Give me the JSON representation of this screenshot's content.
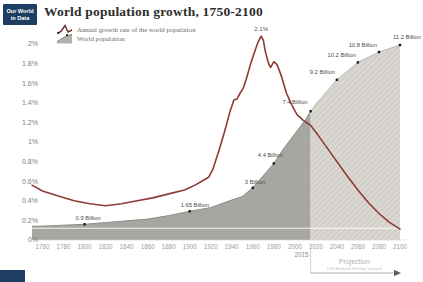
{
  "logo": {
    "line1": "Our World",
    "line2": "in Data"
  },
  "header": {
    "title": "World population growth, 1750-2100"
  },
  "legend": {
    "growth_label": "Annual growth rate of the world population",
    "population_label": "World population"
  },
  "colors": {
    "logo_bg": "#1d3d63",
    "growth_line": "#8e3b35",
    "legend_line_icon": "#6e2f2a",
    "area_historic": "#a8a6a0",
    "area_projection": "#d3d0ca",
    "area_edge_historic": "#8f8d88",
    "area_edge_projection": "#b9b6b0",
    "x_axis_text": "#9d9d9d",
    "y_axis_text": "#7e7e7e",
    "value_label_text": "#4d4d4d",
    "annotation_gray": "#b5b2ad",
    "marker_black": "#1b1b1b",
    "reference_line": "#ffffff"
  },
  "chart_data": {
    "type": "area+line",
    "title": "World population growth, 1750-2100",
    "grid": "off",
    "legend_position": "top-left",
    "x": {
      "min": 1750,
      "max": 2100,
      "ticks": [
        1760,
        1780,
        1800,
        1820,
        1840,
        1860,
        1880,
        1900,
        1920,
        1940,
        1960,
        1980,
        2000,
        2020,
        2040,
        2060,
        2080,
        2100
      ]
    },
    "y_growth": {
      "unit": "%",
      "min": 0,
      "max": 2.1,
      "tick_values": [
        2,
        1.8,
        1.6,
        1.4,
        1.2,
        1,
        0.8,
        0.6,
        0.4,
        0.2,
        0
      ],
      "tick_labels": [
        "2%",
        "1.8%",
        "1.6%",
        "1.4%",
        "1.2%",
        "1%",
        "0.8%",
        "0.6%",
        "0.4%",
        "0.2%",
        "0%"
      ]
    },
    "y_population": {
      "unit": "billion",
      "min": 0,
      "max": 11.2
    },
    "projection_start_year": 2015,
    "series": [
      {
        "name": "Annual growth rate of the world population",
        "type": "line",
        "unit": "%",
        "points": [
          [
            1750,
            0.56
          ],
          [
            1760,
            0.5
          ],
          [
            1775,
            0.45
          ],
          [
            1790,
            0.4
          ],
          [
            1805,
            0.37
          ],
          [
            1820,
            0.35
          ],
          [
            1835,
            0.37
          ],
          [
            1850,
            0.4
          ],
          [
            1865,
            0.43
          ],
          [
            1880,
            0.47
          ],
          [
            1895,
            0.51
          ],
          [
            1905,
            0.56
          ],
          [
            1913,
            0.61
          ],
          [
            1918,
            0.64
          ],
          [
            1922,
            0.72
          ],
          [
            1928,
            0.92
          ],
          [
            1933,
            1.1
          ],
          [
            1938,
            1.3
          ],
          [
            1942,
            1.43
          ],
          [
            1945,
            1.44
          ],
          [
            1948,
            1.5
          ],
          [
            1951,
            1.55
          ],
          [
            1954,
            1.65
          ],
          [
            1958,
            1.8
          ],
          [
            1962,
            1.93
          ],
          [
            1965,
            2.02
          ],
          [
            1968,
            2.08
          ],
          [
            1970,
            2.04
          ],
          [
            1972,
            1.92
          ],
          [
            1975,
            1.8
          ],
          [
            1977,
            1.76
          ],
          [
            1980,
            1.82
          ],
          [
            1983,
            1.79
          ],
          [
            1987,
            1.68
          ],
          [
            1992,
            1.5
          ],
          [
            1997,
            1.38
          ],
          [
            2002,
            1.28
          ],
          [
            2008,
            1.22
          ],
          [
            2015,
            1.17
          ],
          [
            2022,
            1.07
          ],
          [
            2030,
            0.95
          ],
          [
            2040,
            0.8
          ],
          [
            2050,
            0.65
          ],
          [
            2060,
            0.51
          ],
          [
            2070,
            0.38
          ],
          [
            2080,
            0.27
          ],
          [
            2090,
            0.18
          ],
          [
            2100,
            0.11
          ]
        ]
      },
      {
        "name": "World population",
        "type": "area",
        "unit": "billion",
        "points": [
          [
            1750,
            0.79
          ],
          [
            1760,
            0.8
          ],
          [
            1780,
            0.85
          ],
          [
            1800,
            0.9
          ],
          [
            1820,
            1.0
          ],
          [
            1840,
            1.1
          ],
          [
            1860,
            1.2
          ],
          [
            1880,
            1.4
          ],
          [
            1900,
            1.65
          ],
          [
            1920,
            1.86
          ],
          [
            1940,
            2.3
          ],
          [
            1950,
            2.5
          ],
          [
            1960,
            3.0
          ],
          [
            1970,
            3.7
          ],
          [
            1980,
            4.4
          ],
          [
            1990,
            5.3
          ],
          [
            2000,
            6.1
          ],
          [
            2010,
            6.9
          ],
          [
            2015,
            7.4
          ],
          [
            2020,
            7.8
          ],
          [
            2030,
            8.5
          ],
          [
            2040,
            9.2
          ],
          [
            2050,
            9.7
          ],
          [
            2060,
            10.2
          ],
          [
            2070,
            10.5
          ],
          [
            2080,
            10.8
          ],
          [
            2090,
            11.0
          ],
          [
            2100,
            11.2
          ]
        ]
      }
    ],
    "annotations": {
      "peak": {
        "text": "2.1%",
        "year": 1968,
        "value": 2.08
      },
      "population_labels": [
        {
          "text": "0.9 Billion",
          "year": 1800,
          "value": 0.9,
          "anchor": "start",
          "dx": -9,
          "dy": -4
        },
        {
          "text": "1.65 Billion",
          "year": 1900,
          "value": 1.65,
          "anchor": "start",
          "dx": -9,
          "dy": -4
        },
        {
          "text": "3 Billion",
          "year": 1960,
          "value": 3.0,
          "anchor": "start",
          "dx": -8,
          "dy": -4
        },
        {
          "text": "4.4 Billion",
          "year": 1980,
          "value": 4.4,
          "anchor": "start",
          "dx": -16,
          "dy": -6
        },
        {
          "text": "7.4 Billion",
          "year": 2015,
          "value": 7.4,
          "anchor": "end",
          "dx": -3,
          "dy": -7
        },
        {
          "text": "9.2 Billion",
          "year": 2040,
          "value": 9.2,
          "anchor": "end",
          "dx": -2,
          "dy": -6
        },
        {
          "text": "10.2 Billion",
          "year": 2060,
          "value": 10.2,
          "anchor": "end",
          "dx": -2,
          "dy": -5
        },
        {
          "text": "10.8 Billion",
          "year": 2080,
          "value": 10.8,
          "anchor": "end",
          "dx": -2,
          "dy": -5
        },
        {
          "text": "11.2 Billion",
          "year": 2100,
          "value": 11.2,
          "anchor": "end",
          "dx": 21,
          "dy": -6
        }
      ],
      "projection_marker": {
        "label": "2015",
        "title": "Projection",
        "subtitle": "(UN Medium Fertility Variant)"
      },
      "reference_line_pct": 0.12
    }
  }
}
